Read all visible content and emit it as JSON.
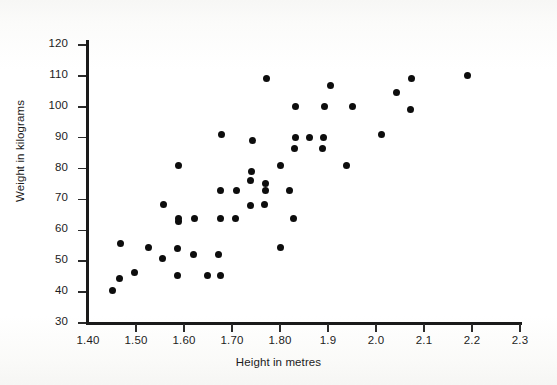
{
  "chart_data": {
    "type": "scatter",
    "title": "",
    "xlabel": "Height in metres",
    "ylabel": "Weight in kilograms",
    "xlim": [
      1.4,
      2.3
    ],
    "ylim": [
      30,
      120
    ],
    "grid": false,
    "legend": "none",
    "marker": {
      "shape": "circle",
      "color": "#0d0d0d",
      "size": 7
    },
    "xticks": [
      1.4,
      1.5,
      1.6,
      1.7,
      1.8,
      1.9,
      2.0,
      2.1,
      2.2,
      2.3
    ],
    "xticklabels": [
      "1.40",
      "1.50",
      "1.60",
      "1.70",
      "1.80",
      "1.9",
      "2.0",
      "2.1",
      "2.2",
      "2.3"
    ],
    "yticks": [
      30,
      40,
      50,
      60,
      70,
      80,
      90,
      100,
      110,
      120
    ],
    "yticklabels": [
      "30",
      "40",
      "50",
      "60",
      "70",
      "80",
      "90",
      "100",
      "110",
      "120"
    ],
    "n_points": 55,
    "points": [
      {
        "x": 1.45,
        "y": 40.5
      },
      {
        "x": 1.465,
        "y": 44.5
      },
      {
        "x": 1.468,
        "y": 55.8
      },
      {
        "x": 1.496,
        "y": 46.4
      },
      {
        "x": 1.525,
        "y": 54.5
      },
      {
        "x": 1.555,
        "y": 50.8
      },
      {
        "x": 1.557,
        "y": 68.3
      },
      {
        "x": 1.586,
        "y": 45.5
      },
      {
        "x": 1.586,
        "y": 54.0
      },
      {
        "x": 1.588,
        "y": 62.8
      },
      {
        "x": 1.588,
        "y": 63.8
      },
      {
        "x": 1.588,
        "y": 81.0
      },
      {
        "x": 1.62,
        "y": 52.3
      },
      {
        "x": 1.622,
        "y": 63.7
      },
      {
        "x": 1.648,
        "y": 45.5
      },
      {
        "x": 1.672,
        "y": 52.3
      },
      {
        "x": 1.675,
        "y": 72.8
      },
      {
        "x": 1.676,
        "y": 45.5
      },
      {
        "x": 1.677,
        "y": 63.7
      },
      {
        "x": 1.678,
        "y": 91.0
      },
      {
        "x": 1.708,
        "y": 63.7
      },
      {
        "x": 1.71,
        "y": 72.8
      },
      {
        "x": 1.738,
        "y": 68.2
      },
      {
        "x": 1.739,
        "y": 76.0
      },
      {
        "x": 1.74,
        "y": 79.2
      },
      {
        "x": 1.742,
        "y": 89.2
      },
      {
        "x": 1.768,
        "y": 68.5
      },
      {
        "x": 1.769,
        "y": 72.8
      },
      {
        "x": 1.77,
        "y": 75.2
      },
      {
        "x": 1.772,
        "y": 109.2
      },
      {
        "x": 1.8,
        "y": 54.5
      },
      {
        "x": 1.802,
        "y": 81.0
      },
      {
        "x": 1.82,
        "y": 72.8
      },
      {
        "x": 1.828,
        "y": 63.7
      },
      {
        "x": 1.83,
        "y": 86.6
      },
      {
        "x": 1.832,
        "y": 90.0
      },
      {
        "x": 1.833,
        "y": 100.0
      },
      {
        "x": 1.862,
        "y": 90.0
      },
      {
        "x": 1.888,
        "y": 86.6
      },
      {
        "x": 1.89,
        "y": 90.0
      },
      {
        "x": 1.892,
        "y": 100.0
      },
      {
        "x": 1.905,
        "y": 107.0
      },
      {
        "x": 1.938,
        "y": 81.0
      },
      {
        "x": 1.952,
        "y": 100.0
      },
      {
        "x": 2.012,
        "y": 91.0
      },
      {
        "x": 2.042,
        "y": 104.6
      },
      {
        "x": 2.072,
        "y": 99.2
      },
      {
        "x": 2.074,
        "y": 109.2
      },
      {
        "x": 2.19,
        "y": 110.0
      }
    ]
  }
}
